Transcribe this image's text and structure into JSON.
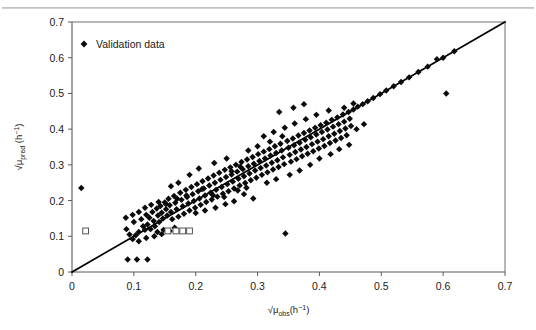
{
  "figure": {
    "background": "#ffffff",
    "plot_area": {
      "left": 72,
      "right": 505,
      "top": 22,
      "bottom": 272
    }
  },
  "legend": {
    "position": "top-left-inside",
    "entries": [
      {
        "label": "Validation data",
        "marker": "filled-diamond",
        "color": "#0b0b0b"
      }
    ]
  },
  "chart_data": {
    "type": "scatter",
    "title": "",
    "xlabel": "√μ_obs (h⁻¹)",
    "ylabel": "√μ_pred (h⁻¹)",
    "xlabel_parts": {
      "root": "√",
      "mu": "μ",
      "sub": "obs",
      "unit_open": "(h",
      "sup": "−1",
      "unit_close": ")"
    },
    "ylabel_parts": {
      "root": "√",
      "mu": "μ",
      "sub": "pred",
      "unit_open": " (h",
      "sup": "−1",
      "unit_close": ")"
    },
    "xlim": [
      0,
      0.7
    ],
    "ylim": [
      0,
      0.7
    ],
    "xticks": [
      0,
      0.1,
      0.2,
      0.3,
      0.4,
      0.5,
      0.6,
      0.7
    ],
    "yticks": [
      0,
      0.1,
      0.2,
      0.3,
      0.4,
      0.5,
      0.6,
      0.7
    ],
    "xticklabels": [
      "0",
      "0.1",
      "0.2",
      "0.3",
      "0.4",
      "0.5",
      "0.6",
      "0.7"
    ],
    "yticklabels": [
      "0",
      "0.1",
      "0.2",
      "0.3",
      "0.4",
      "0.5",
      "0.6",
      "0.7"
    ],
    "grid": false,
    "legend_position": "upper left",
    "reference_line": {
      "name": "1:1 identity line",
      "x": [
        0,
        0.7
      ],
      "y": [
        0,
        0.7
      ],
      "color": "#000000",
      "width": 1.7
    },
    "series": [
      {
        "name": "Validation data",
        "marker": "filled-diamond",
        "color": "#0b0b0b",
        "size": 5.2,
        "points": [
          [
            0.015,
            0.235
          ],
          [
            0.09,
            0.035
          ],
          [
            0.105,
            0.035
          ],
          [
            0.122,
            0.035
          ],
          [
            0.088,
            0.12
          ],
          [
            0.093,
            0.105
          ],
          [
            0.1,
            0.14
          ],
          [
            0.103,
            0.103
          ],
          [
            0.108,
            0.112
          ],
          [
            0.112,
            0.148
          ],
          [
            0.115,
            0.128
          ],
          [
            0.118,
            0.118
          ],
          [
            0.12,
            0.16
          ],
          [
            0.122,
            0.133
          ],
          [
            0.125,
            0.152
          ],
          [
            0.127,
            0.12
          ],
          [
            0.13,
            0.168
          ],
          [
            0.132,
            0.143
          ],
          [
            0.134,
            0.128
          ],
          [
            0.137,
            0.178
          ],
          [
            0.139,
            0.158
          ],
          [
            0.141,
            0.14
          ],
          [
            0.143,
            0.185
          ],
          [
            0.145,
            0.166
          ],
          [
            0.147,
            0.15
          ],
          [
            0.15,
            0.195
          ],
          [
            0.152,
            0.176
          ],
          [
            0.154,
            0.158
          ],
          [
            0.156,
            0.205
          ],
          [
            0.158,
            0.187
          ],
          [
            0.16,
            0.168
          ],
          [
            0.162,
            0.148
          ],
          [
            0.165,
            0.213
          ],
          [
            0.167,
            0.194
          ],
          [
            0.169,
            0.176
          ],
          [
            0.172,
            0.155
          ],
          [
            0.175,
            0.222
          ],
          [
            0.177,
            0.202
          ],
          [
            0.179,
            0.184
          ],
          [
            0.181,
            0.163
          ],
          [
            0.184,
            0.23
          ],
          [
            0.186,
            0.21
          ],
          [
            0.188,
            0.192
          ],
          [
            0.19,
            0.172
          ],
          [
            0.193,
            0.238
          ],
          [
            0.195,
            0.218
          ],
          [
            0.197,
            0.199
          ],
          [
            0.199,
            0.18
          ],
          [
            0.202,
            0.246
          ],
          [
            0.204,
            0.226
          ],
          [
            0.206,
            0.206
          ],
          [
            0.208,
            0.188
          ],
          [
            0.211,
            0.254
          ],
          [
            0.213,
            0.234
          ],
          [
            0.215,
            0.214
          ],
          [
            0.217,
            0.196
          ],
          [
            0.22,
            0.262
          ],
          [
            0.222,
            0.242
          ],
          [
            0.224,
            0.222
          ],
          [
            0.226,
            0.203
          ],
          [
            0.229,
            0.27
          ],
          [
            0.231,
            0.25
          ],
          [
            0.233,
            0.23
          ],
          [
            0.235,
            0.211
          ],
          [
            0.238,
            0.278
          ],
          [
            0.24,
            0.258
          ],
          [
            0.242,
            0.238
          ],
          [
            0.244,
            0.219
          ],
          [
            0.247,
            0.286
          ],
          [
            0.249,
            0.266
          ],
          [
            0.251,
            0.246
          ],
          [
            0.253,
            0.226
          ],
          [
            0.256,
            0.293
          ],
          [
            0.258,
            0.273
          ],
          [
            0.26,
            0.253
          ],
          [
            0.262,
            0.234
          ],
          [
            0.265,
            0.3
          ],
          [
            0.267,
            0.281
          ],
          [
            0.269,
            0.261
          ],
          [
            0.271,
            0.242
          ],
          [
            0.274,
            0.308
          ],
          [
            0.276,
            0.288
          ],
          [
            0.278,
            0.268
          ],
          [
            0.28,
            0.249
          ],
          [
            0.283,
            0.315
          ],
          [
            0.285,
            0.296
          ],
          [
            0.287,
            0.276
          ],
          [
            0.289,
            0.257
          ],
          [
            0.292,
            0.322
          ],
          [
            0.294,
            0.303
          ],
          [
            0.296,
            0.284
          ],
          [
            0.298,
            0.264
          ],
          [
            0.301,
            0.33
          ],
          [
            0.303,
            0.311
          ],
          [
            0.305,
            0.291
          ],
          [
            0.307,
            0.272
          ],
          [
            0.31,
            0.337
          ],
          [
            0.312,
            0.318
          ],
          [
            0.314,
            0.298
          ],
          [
            0.316,
            0.279
          ],
          [
            0.319,
            0.344
          ],
          [
            0.321,
            0.326
          ],
          [
            0.323,
            0.306
          ],
          [
            0.325,
            0.287
          ],
          [
            0.328,
            0.352
          ],
          [
            0.33,
            0.333
          ],
          [
            0.332,
            0.313
          ],
          [
            0.334,
            0.294
          ],
          [
            0.337,
            0.359
          ],
          [
            0.339,
            0.34
          ],
          [
            0.341,
            0.321
          ],
          [
            0.343,
            0.302
          ],
          [
            0.345,
            0.108
          ],
          [
            0.348,
            0.367
          ],
          [
            0.35,
            0.348
          ],
          [
            0.352,
            0.328
          ],
          [
            0.354,
            0.309
          ],
          [
            0.357,
            0.374
          ],
          [
            0.359,
            0.355
          ],
          [
            0.361,
            0.336
          ],
          [
            0.363,
            0.316
          ],
          [
            0.366,
            0.382
          ],
          [
            0.368,
            0.362
          ],
          [
            0.37,
            0.343
          ],
          [
            0.372,
            0.324
          ],
          [
            0.375,
            0.389
          ],
          [
            0.377,
            0.37
          ],
          [
            0.379,
            0.35
          ],
          [
            0.381,
            0.331
          ],
          [
            0.384,
            0.396
          ],
          [
            0.386,
            0.377
          ],
          [
            0.388,
            0.358
          ],
          [
            0.39,
            0.338
          ],
          [
            0.393,
            0.404
          ],
          [
            0.395,
            0.385
          ],
          [
            0.397,
            0.365
          ],
          [
            0.399,
            0.346
          ],
          [
            0.402,
            0.411
          ],
          [
            0.404,
            0.392
          ],
          [
            0.406,
            0.372
          ],
          [
            0.408,
            0.353
          ],
          [
            0.411,
            0.418
          ],
          [
            0.413,
            0.399
          ],
          [
            0.415,
            0.38
          ],
          [
            0.417,
            0.361
          ],
          [
            0.42,
            0.426
          ],
          [
            0.422,
            0.407
          ],
          [
            0.424,
            0.387
          ],
          [
            0.426,
            0.368
          ],
          [
            0.429,
            0.433
          ],
          [
            0.431,
            0.414
          ],
          [
            0.433,
            0.395
          ],
          [
            0.435,
            0.375
          ],
          [
            0.438,
            0.441
          ],
          [
            0.44,
            0.421
          ],
          [
            0.442,
            0.402
          ],
          [
            0.444,
            0.383
          ],
          [
            0.447,
            0.448
          ],
          [
            0.449,
            0.429
          ],
          [
            0.451,
            0.409
          ],
          [
            0.455,
            0.455
          ],
          [
            0.462,
            0.463
          ],
          [
            0.47,
            0.47
          ],
          [
            0.478,
            0.478
          ],
          [
            0.487,
            0.487
          ],
          [
            0.498,
            0.498
          ],
          [
            0.508,
            0.508
          ],
          [
            0.52,
            0.52
          ],
          [
            0.532,
            0.532
          ],
          [
            0.545,
            0.545
          ],
          [
            0.56,
            0.56
          ],
          [
            0.575,
            0.575
          ],
          [
            0.59,
            0.596
          ],
          [
            0.6,
            0.6
          ],
          [
            0.605,
            0.5
          ],
          [
            0.618,
            0.618
          ],
          [
            0.285,
            0.34
          ],
          [
            0.23,
            0.305
          ],
          [
            0.25,
            0.318
          ],
          [
            0.205,
            0.29
          ],
          [
            0.19,
            0.272
          ],
          [
            0.3,
            0.352
          ],
          [
            0.32,
            0.365
          ],
          [
            0.34,
            0.38
          ],
          [
            0.16,
            0.24
          ],
          [
            0.172,
            0.25
          ],
          [
            0.21,
            0.232
          ],
          [
            0.228,
            0.215
          ],
          [
            0.246,
            0.21
          ],
          [
            0.262,
            0.198
          ],
          [
            0.278,
            0.218
          ],
          [
            0.293,
            0.206
          ],
          [
            0.17,
            0.205
          ],
          [
            0.185,
            0.214
          ],
          [
            0.152,
            0.19
          ],
          [
            0.14,
            0.196
          ],
          [
            0.128,
            0.188
          ],
          [
            0.118,
            0.18
          ],
          [
            0.108,
            0.168
          ],
          [
            0.098,
            0.16
          ],
          [
            0.087,
            0.152
          ],
          [
            0.098,
            0.092
          ],
          [
            0.108,
            0.086
          ],
          [
            0.12,
            0.095
          ],
          [
            0.133,
            0.1
          ],
          [
            0.145,
            0.106
          ],
          [
            0.158,
            0.115
          ],
          [
            0.166,
            0.124
          ],
          [
            0.148,
            0.118
          ],
          [
            0.138,
            0.112
          ],
          [
            0.2,
            0.165
          ],
          [
            0.215,
            0.172
          ],
          [
            0.232,
            0.18
          ],
          [
            0.248,
            0.19
          ],
          [
            0.268,
            0.228
          ],
          [
            0.282,
            0.236
          ],
          [
            0.258,
            0.282
          ],
          [
            0.272,
            0.295
          ],
          [
            0.315,
            0.25
          ],
          [
            0.33,
            0.26
          ],
          [
            0.352,
            0.272
          ],
          [
            0.368,
            0.284
          ],
          [
            0.385,
            0.3
          ],
          [
            0.4,
            0.318
          ],
          [
            0.418,
            0.33
          ],
          [
            0.432,
            0.344
          ],
          [
            0.448,
            0.356
          ],
          [
            0.46,
            0.4
          ],
          [
            0.472,
            0.414
          ],
          [
            0.44,
            0.46
          ],
          [
            0.455,
            0.472
          ],
          [
            0.415,
            0.452
          ],
          [
            0.395,
            0.44
          ],
          [
            0.378,
            0.428
          ],
          [
            0.36,
            0.416
          ],
          [
            0.344,
            0.404
          ],
          [
            0.326,
            0.392
          ],
          [
            0.31,
            0.38
          ],
          [
            0.358,
            0.46
          ],
          [
            0.375,
            0.47
          ],
          [
            0.335,
            0.448
          ]
        ]
      },
      {
        "name": "Open square markers",
        "marker": "open-square",
        "color": "#ffffff",
        "edge_color": "#555555",
        "size": 5.0,
        "points": [
          [
            0.022,
            0.115
          ],
          [
            0.155,
            0.115
          ],
          [
            0.168,
            0.115
          ],
          [
            0.179,
            0.115
          ],
          [
            0.19,
            0.115
          ]
        ]
      }
    ]
  }
}
